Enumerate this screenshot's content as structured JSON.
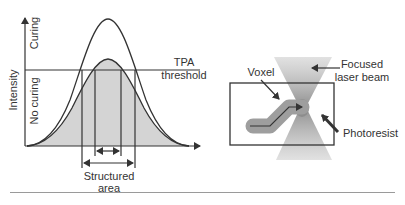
{
  "left_panel": {
    "y_axis_label": "Intensity",
    "region_upper_label": "Curing",
    "region_lower_label": "No curing",
    "threshold_label_line1": "TPA",
    "threshold_label_line2": "threshold",
    "structured_label_line1": "Structured",
    "structured_label_line2": "area"
  },
  "right_panel": {
    "voxel_label": "Voxel",
    "beam_label_line1": "Focused",
    "beam_label_line2": "laser beam",
    "photoresist_label": "Photoresist"
  },
  "colors": {
    "line": "#333333",
    "fill": "#d4d4d4",
    "beam": "#8a8a8a",
    "voxel": "#9e9e9e"
  }
}
